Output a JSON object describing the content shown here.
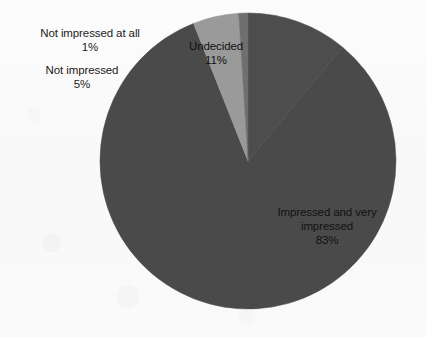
{
  "chart_data": {
    "type": "pie",
    "title": "",
    "subtitle": "",
    "xlabel": "",
    "ylabel": "",
    "legend_position": "none",
    "grid": false,
    "value_unit": "%",
    "start_angle_deg": 0,
    "direction": "clockwise",
    "categories": [
      "Undecided",
      "Impressed and very impressed",
      "Not impressed",
      "Not impressed at all"
    ],
    "values": [
      11,
      83,
      5,
      1
    ],
    "labels_text": [
      "Undecided\n11%",
      "Impressed and very\nimpressed\n83%",
      "Not impressed\n5%",
      "Not impressed at all\n1%"
    ],
    "slices": [
      {
        "name": "Undecided",
        "value": 11,
        "display_value": "11%",
        "color": "#4d4d4d",
        "label_placement": "inside"
      },
      {
        "name": "Impressed and very impressed",
        "value": 83,
        "display_value": "83%",
        "color": "#4a4a4a",
        "label_placement": "inside"
      },
      {
        "name": "Not impressed",
        "value": 5,
        "display_value": "5%",
        "color": "#9a9a9a",
        "label_placement": "outside-left"
      },
      {
        "name": "Not impressed at all",
        "value": 1,
        "display_value": "1%",
        "color": "#6f6f6f",
        "label_placement": "outside-left"
      }
    ]
  },
  "labels": {
    "not_impressed_at_all": "Not impressed at all\n1%",
    "not_impressed": "Not impressed\n5%",
    "undecided": "Undecided\n11%",
    "impressed": "Impressed and very\nimpressed\n83%"
  },
  "colors": {
    "background": "#fbfbfb",
    "slice_dark": "#4a4a4a",
    "slice_undecided": "#4d4d4d",
    "slice_mid": "#6f6f6f",
    "slice_light": "#9a9a9a",
    "label_text": "#1c1c1c"
  },
  "caption": {
    "text": ""
  }
}
